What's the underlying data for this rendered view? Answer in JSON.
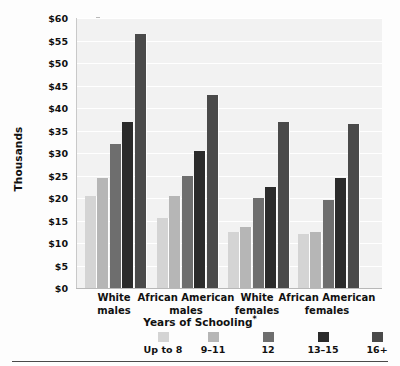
{
  "chart_data": {
    "type": "bar",
    "title": "",
    "xlabel": "Years of Schooling*",
    "ylabel": "Thousands",
    "categories": [
      "White\nmales",
      "African American\nmales",
      "White\nfemales",
      "African American\nfemales"
    ],
    "category_labels": [
      {
        "line1": "White",
        "line2": "males"
      },
      {
        "line1": "African American",
        "line2": "males"
      },
      {
        "line1": "White",
        "line2": "females"
      },
      {
        "line1": "African American",
        "line2": "females"
      }
    ],
    "series": [
      {
        "name": "Up to 8",
        "color": "#d4d4d4",
        "values": [
          20.5,
          15.5,
          12.5,
          12.0
        ]
      },
      {
        "name": "9–11",
        "color": "#b6b6b6",
        "values": [
          24.5,
          20.5,
          13.5,
          12.5
        ]
      },
      {
        "name": "12",
        "color": "#6e6e6e",
        "values": [
          32.0,
          25.0,
          20.0,
          19.5
        ]
      },
      {
        "name": "13–15",
        "color": "#2b2b2b",
        "values": [
          37.0,
          30.5,
          22.5,
          24.5
        ]
      },
      {
        "name": "16+",
        "color": "#4a4a4a",
        "values": [
          56.5,
          43.0,
          37.0,
          36.5
        ]
      }
    ],
    "ylim": [
      0,
      60
    ],
    "ytick_step": 5,
    "ytick_labels": [
      "$60",
      "$55",
      "$50",
      "$45",
      "$40",
      "$35",
      "$30",
      "$25",
      "$20",
      "$15",
      "$10",
      "$5",
      "$0"
    ],
    "ytick_values": [
      60,
      55,
      50,
      45,
      40,
      35,
      30,
      25,
      20,
      15,
      10,
      5,
      0
    ],
    "grid": true,
    "legend_position": "bottom",
    "plot_background": "#f2f2f2",
    "gridline_color": "#ffffff",
    "footnote_marker": "*"
  }
}
